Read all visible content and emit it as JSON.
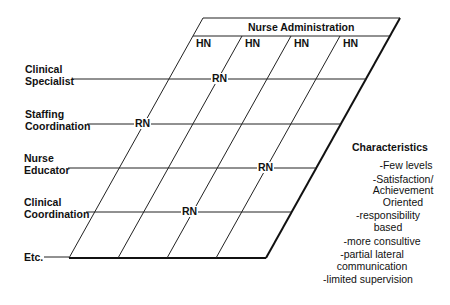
{
  "header": {
    "title": "Nurse Administration",
    "columns": [
      "HN",
      "HN",
      "HN",
      "HN"
    ]
  },
  "rows": [
    {
      "label": "Clinical\nSpecialist",
      "marker": "RN"
    },
    {
      "label": "Staffing\nCoordination",
      "marker": "RN"
    },
    {
      "label": "Nurse\nEducator",
      "marker": "RN"
    },
    {
      "label": "Clinical\nCoordination",
      "marker": "RN"
    },
    {
      "label": "Etc.",
      "marker": ""
    }
  ],
  "characteristics": {
    "title": "Characteristics",
    "items": [
      "-Few levels",
      "-Satisfaction/\nAchievement\nOriented",
      "-responsibility\nbased",
      "-more consultive",
      "-partial lateral\ncommunication",
      "-limited supervision"
    ]
  },
  "colors": {
    "line": "#222222",
    "background": "#ffffff"
  }
}
